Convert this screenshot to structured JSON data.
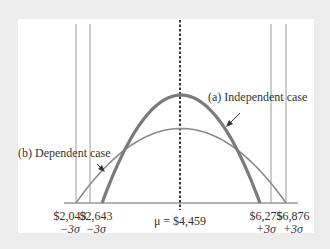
{
  "diagram": {
    "type": "normal-distribution-comparison",
    "mean_label": "μ = $4,459",
    "mean_value": 4459,
    "curves": [
      {
        "id": "independent",
        "label": "(a) Independent case",
        "lower": 2643,
        "upper": 6275,
        "relative_peak": 1.0,
        "color": "#7a7a7a"
      },
      {
        "id": "dependent",
        "label": "(b) Dependent case",
        "lower": 2043,
        "upper": 6876,
        "relative_peak": 0.69,
        "color": "#8a8a8a"
      }
    ],
    "ticks": [
      {
        "value": "$2,043",
        "sigma": "−3σ",
        "x_value": 2043
      },
      {
        "value": "$2,643",
        "sigma": "−3σ",
        "x_value": 2643
      },
      {
        "value": "$6,275",
        "sigma": "+3σ",
        "x_value": 6275
      },
      {
        "value": "$6,876",
        "sigma": "+3σ",
        "x_value": 6876
      }
    ]
  }
}
